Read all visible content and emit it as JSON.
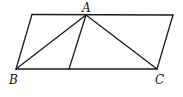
{
  "figure": {
    "type": "geometry-diagram",
    "labels": {
      "A": "A",
      "B": "B",
      "C": "C"
    },
    "points": {
      "top_left": [
        32,
        14
      ],
      "A": [
        86,
        15
      ],
      "top_right": [
        173,
        15
      ],
      "B": [
        16,
        69
      ],
      "D_foot": [
        69,
        69
      ],
      "C": [
        157,
        69
      ]
    },
    "segments": [
      [
        "top_left",
        "top_right"
      ],
      [
        "B",
        "C"
      ],
      [
        "top_left",
        "B"
      ],
      [
        "top_right",
        "C"
      ],
      [
        "A",
        "B"
      ],
      [
        "A",
        "C"
      ],
      [
        "A",
        "D_foot"
      ]
    ],
    "stroke_color": "#1a1a1a"
  }
}
